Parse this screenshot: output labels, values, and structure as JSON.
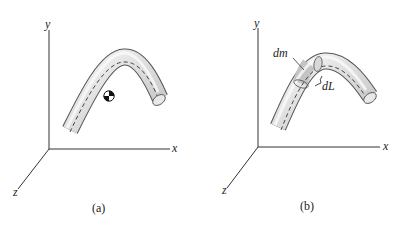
{
  "panels": [
    {
      "id": "a",
      "caption": "(a)",
      "axes": {
        "x": "x",
        "y": "y",
        "z": "z"
      },
      "markers": [
        "center-of-mass-symbol"
      ]
    },
    {
      "id": "b",
      "caption": "(b)",
      "axes": {
        "x": "x",
        "y": "y",
        "z": "z"
      },
      "labels": {
        "mass_element": "dm",
        "length_element": "dL"
      }
    }
  ],
  "colors": {
    "tube_fill": "#e2e2e2",
    "tube_highlight": "#f7f7f7",
    "tube_outline": "#555555",
    "axis": "#333333",
    "element_shade": "#c9c9c9"
  }
}
